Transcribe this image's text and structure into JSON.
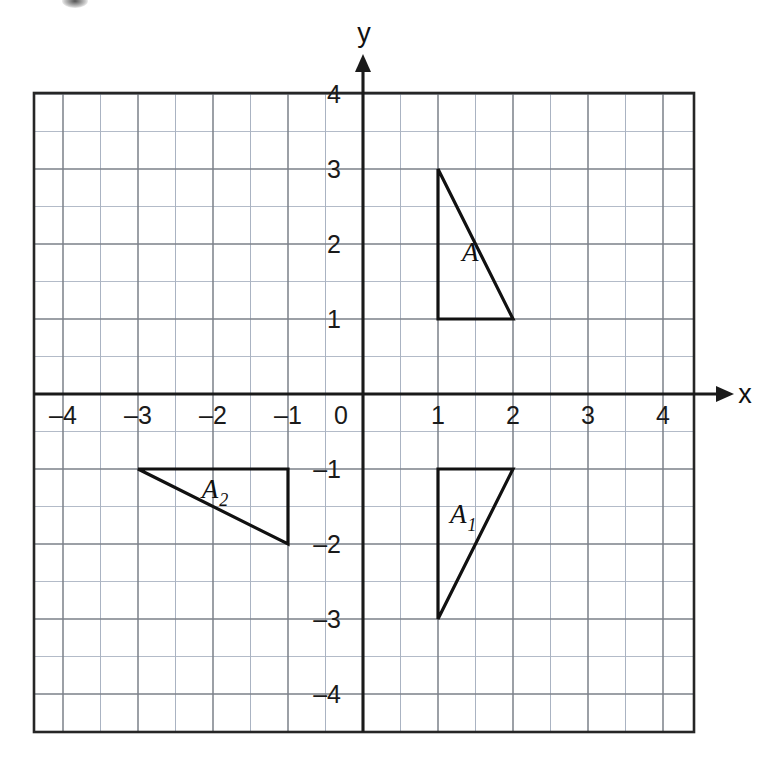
{
  "figure": {
    "background_color": "#ffffff"
  },
  "axes": {
    "x_axis_label": "x",
    "y_axis_label": "y",
    "origin_label": "0",
    "x_tick_labels": [
      "–4",
      "–3",
      "–2",
      "–1",
      "1",
      "2",
      "3",
      "4"
    ],
    "y_tick_labels": [
      "4",
      "3",
      "2",
      "1",
      "–1",
      "–2",
      "–3",
      "–4"
    ],
    "axis_color": "#1a1a1a",
    "major_grid_color": "#7b8089",
    "minor_grid_color": "#aab3c2",
    "border_color": "#262626"
  },
  "chart_data": {
    "type": "scatter",
    "xlabel": "x",
    "ylabel": "y",
    "xlim": [
      -4.5,
      4.5
    ],
    "ylim": [
      -4.5,
      4.5
    ],
    "xticks": [
      -4,
      -3,
      -2,
      -1,
      0,
      1,
      2,
      3,
      4
    ],
    "yticks": [
      -4,
      -3,
      -2,
      -1,
      0,
      1,
      2,
      3,
      4
    ],
    "grid": true,
    "major_grid_step": 1,
    "minor_grid_step": 0.5,
    "legend": "none",
    "shapes": [
      {
        "name": "A",
        "label": "A",
        "subscript": "",
        "kind": "triangle",
        "vertices": [
          [
            1,
            3
          ],
          [
            1,
            1
          ],
          [
            2,
            1
          ]
        ],
        "label_position": [
          1.32,
          1.78
        ],
        "stroke": "#111111",
        "fill": "none"
      },
      {
        "name": "A1",
        "label": "A",
        "subscript": "1",
        "kind": "triangle",
        "vertices": [
          [
            1,
            -1
          ],
          [
            2,
            -1
          ],
          [
            1,
            -3
          ]
        ],
        "label_position": [
          1.16,
          -1.72
        ],
        "stroke": "#111111",
        "fill": "none"
      },
      {
        "name": "A2",
        "label": "A",
        "subscript": "2",
        "kind": "triangle",
        "vertices": [
          [
            -3,
            -1
          ],
          [
            -1,
            -1
          ],
          [
            -1,
            -2
          ]
        ],
        "label_position": [
          -2.15,
          -1.38
        ],
        "stroke": "#111111",
        "fill": "none"
      }
    ]
  }
}
